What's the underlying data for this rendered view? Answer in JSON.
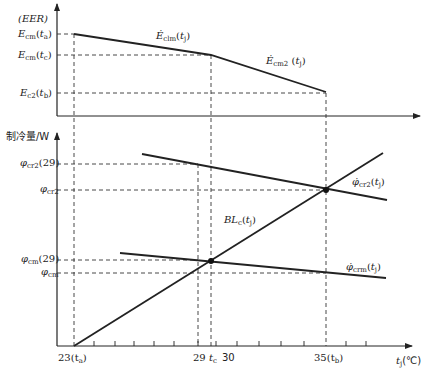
{
  "top_chart": {
    "y_axis_label": "(EER)",
    "y_ticks": [
      {
        "id": "ecm_ta",
        "main": "E",
        "sub": "cm",
        "arg": "t",
        "arg_sub": "a",
        "y": 34
      },
      {
        "id": "ecm_tc",
        "main": "E",
        "sub": "cm",
        "arg": "t",
        "arg_sub": "c",
        "y": 55
      },
      {
        "id": "ec2_tb",
        "main": "E",
        "sub": "c2",
        "arg": "t",
        "arg_sub": "b",
        "y": 93
      }
    ],
    "curves": [
      {
        "id": "eclm",
        "label_main": "Ė",
        "label_sub": "clm",
        "label_arg": "t",
        "label_arg_sub": "j",
        "points": [
          [
            74,
            34
          ],
          [
            211,
            55
          ]
        ]
      },
      {
        "id": "ecm2",
        "label_main": "Ė",
        "label_sub": "cm2",
        "label_arg": "t",
        "label_arg_sub": "j",
        "points": [
          [
            211,
            55
          ],
          [
            326,
            92
          ]
        ]
      }
    ]
  },
  "bottom_chart": {
    "y_axis_label": "制冷量/W",
    "x_axis_label_main": "t",
    "x_axis_label_sub": "j",
    "x_axis_unit": "(℃)",
    "y_ticks": [
      {
        "id": "phi_cr2_29",
        "main": "φ",
        "sub": "cr2",
        "suffix": "(29)",
        "y": 164
      },
      {
        "id": "phi_cr2",
        "main": "φ",
        "sub": "cr2",
        "suffix": "",
        "y": 190
      },
      {
        "id": "phi_cm_29",
        "main": "φ",
        "sub": "cm",
        "suffix": "(29)",
        "y": 260
      },
      {
        "id": "phi_cm",
        "main": "φ",
        "sub": "cm",
        "suffix": "",
        "y": 273
      }
    ],
    "x_ticks": [
      {
        "label": "23",
        "suffix": "(t",
        "suffix_sub": "a",
        "close": ")"
      },
      {
        "label": "29",
        "suffix": " t",
        "suffix_sub": "c",
        "close": ""
      },
      {
        "label": "30",
        "suffix": "",
        "suffix_sub": "",
        "close": ""
      },
      {
        "label": "35",
        "suffix": "(t",
        "suffix_sub": "b",
        "close": ")"
      }
    ],
    "curves": [
      {
        "id": "phi_cr2_tj",
        "label_main": "φ̇",
        "label_sub": "cr2",
        "label_arg": "t",
        "label_arg_sub": "j"
      },
      {
        "id": "bl_c",
        "label_main": "BL",
        "label_sub": "c",
        "label_arg": "t",
        "label_arg_sub": "j"
      },
      {
        "id": "phi_crm_tj",
        "label_main": "φ̇",
        "label_sub": "crm",
        "label_arg": "t",
        "label_arg_sub": "j"
      }
    ]
  },
  "colors": {
    "line": "#222222",
    "dashed": "#333333",
    "background": "#ffffff"
  }
}
